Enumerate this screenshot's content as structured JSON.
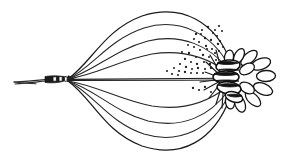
{
  "figure": {
    "title": "Scientific line drawing of elongate ribbed organism",
    "subject_name": "ribbed-body-specimen",
    "style": "ink line drawing with stipple shading",
    "background_color": "#ffffff",
    "ink_color": "#1a1a1a",
    "canvas": {
      "width": 293,
      "height": 161
    },
    "parts": [
      {
        "name": "basal-stalk",
        "label": "tapering basal stalk",
        "description": "thin tapering line entering from left edge",
        "start": [
          14,
          82
        ],
        "end": [
          46,
          79
        ]
      },
      {
        "name": "basal-node",
        "label": "dark segmented basal node",
        "description": "short dark banded swelling where stalk meets ribs",
        "center": [
          56,
          79
        ],
        "width": 22,
        "height": 7
      },
      {
        "name": "rib-bundle-upper",
        "label": "upper rib bundle",
        "count": 4
      },
      {
        "name": "rib-bundle-lower",
        "label": "lower rib bundle",
        "count": 4
      },
      {
        "name": "median-axis",
        "label": "median axis line",
        "start": [
          68,
          79
        ],
        "end": [
          222,
          79
        ]
      },
      {
        "name": "stipple-field",
        "label": "stippled shading field",
        "dot_count": 54,
        "region": "upper right quadrant between ribs and apex"
      },
      {
        "name": "apical-rosette",
        "label": "apical rosette of lobes",
        "lobe_count": 11,
        "center": [
          232,
          79
        ]
      },
      {
        "name": "apical-core",
        "label": "dark segmented apical core",
        "segment_count": 4,
        "center": [
          228,
          79
        ]
      }
    ],
    "geometry": {
      "left_convergence": [
        68,
        79
      ],
      "right_convergence": [
        224,
        79
      ],
      "upper_ribs": [
        "M68,79 C92,62 104,30 142,16 C182,3 216,22 231,63",
        "M68,79 C94,66 108,40 144,28 C180,17 212,34 229,66",
        "M68,79 C96,70 114,50 148,41 C182,33 210,46 228,69",
        "M68,79 C98,74 120,60 152,54 C184,49 208,58 227,72"
      ],
      "lower_ribs": [
        "M68,81 C92,98 104,132 142,146 C182,159 214,140 230,98",
        "M68,81 C94,94 108,122 144,134 C180,145 212,128 229,95",
        "M68,81 C96,90 114,112 148,121 C182,129 210,116 228,91",
        "M68,81 C98,86 120,100 152,106 C184,111 208,102 227,87"
      ],
      "stipple_dots": [
        [
          196,
          34
        ],
        [
          202,
          30
        ],
        [
          208,
          27
        ],
        [
          213,
          33
        ],
        [
          205,
          38
        ],
        [
          199,
          42
        ],
        [
          211,
          40
        ],
        [
          217,
          36
        ],
        [
          206,
          46
        ],
        [
          212,
          49
        ],
        [
          218,
          44
        ],
        [
          200,
          50
        ],
        [
          194,
          47
        ],
        [
          189,
          53
        ],
        [
          196,
          57
        ],
        [
          203,
          55
        ],
        [
          209,
          57
        ],
        [
          215,
          53
        ],
        [
          185,
          59
        ],
        [
          191,
          62
        ],
        [
          197,
          64
        ],
        [
          204,
          62
        ],
        [
          210,
          64
        ],
        [
          216,
          60
        ],
        [
          180,
          64
        ],
        [
          186,
          67
        ],
        [
          192,
          69
        ],
        [
          198,
          68
        ],
        [
          205,
          69
        ],
        [
          211,
          68
        ],
        [
          174,
          68
        ],
        [
          179,
          71
        ],
        [
          185,
          72
        ],
        [
          191,
          73
        ],
        [
          197,
          73
        ],
        [
          203,
          73
        ],
        [
          215,
          30
        ],
        [
          219,
          26
        ],
        [
          222,
          31
        ],
        [
          220,
          41
        ],
        [
          223,
          47
        ],
        [
          219,
          51
        ],
        [
          167,
          71
        ],
        [
          172,
          74
        ],
        [
          178,
          75
        ],
        [
          207,
          49
        ],
        [
          201,
          34
        ],
        [
          194,
          39
        ],
        [
          188,
          45
        ],
        [
          182,
          52
        ],
        [
          193,
          88
        ],
        [
          199,
          90
        ],
        [
          205,
          87
        ],
        [
          211,
          92
        ]
      ],
      "rays": [
        "M224,79 L206,62",
        "M224,79 L210,55",
        "M224,79 L216,50",
        "M224,79 L205,72",
        "M224,79 L200,82",
        "M224,79 L204,90",
        "M224,79 L209,98",
        "M224,79 L216,104",
        "M224,79 L222,108"
      ],
      "petals": [
        {
          "cx": 249,
          "cy": 58,
          "rx": 10,
          "ry": 5,
          "rot": -42
        },
        {
          "cx": 261,
          "cy": 64,
          "rx": 10,
          "ry": 5.5,
          "rot": -20
        },
        {
          "cx": 266,
          "cy": 76,
          "rx": 9.5,
          "ry": 5.5,
          "rot": -2
        },
        {
          "cx": 263,
          "cy": 89,
          "rx": 10,
          "ry": 5.5,
          "rot": 22
        },
        {
          "cx": 253,
          "cy": 99,
          "rx": 9.5,
          "ry": 5,
          "rot": 44
        },
        {
          "cx": 240,
          "cy": 104,
          "rx": 8.5,
          "ry": 5,
          "rot": 68
        },
        {
          "cx": 239,
          "cy": 56,
          "rx": 8,
          "ry": 4.5,
          "rot": -62
        },
        {
          "cx": 229,
          "cy": 57,
          "rx": 7,
          "ry": 4.5,
          "rot": -80
        },
        {
          "cx": 247,
          "cy": 69,
          "rx": 8,
          "ry": 5,
          "rot": -28
        },
        {
          "cx": 247,
          "cy": 88,
          "rx": 8,
          "ry": 5,
          "rot": 30
        },
        {
          "cx": 230,
          "cy": 102,
          "rx": 7,
          "ry": 4.5,
          "rot": 82
        }
      ],
      "core_segments": [
        {
          "cx": 228,
          "cy": 66,
          "rx": 12,
          "ry": 6,
          "rot": -6
        },
        {
          "cx": 226,
          "cy": 77,
          "rx": 13,
          "ry": 6,
          "rot": 0
        },
        {
          "cx": 229,
          "cy": 88,
          "rx": 12,
          "ry": 6,
          "rot": 8
        },
        {
          "cx": 234,
          "cy": 97,
          "rx": 9,
          "ry": 5,
          "rot": 18
        }
      ]
    }
  }
}
